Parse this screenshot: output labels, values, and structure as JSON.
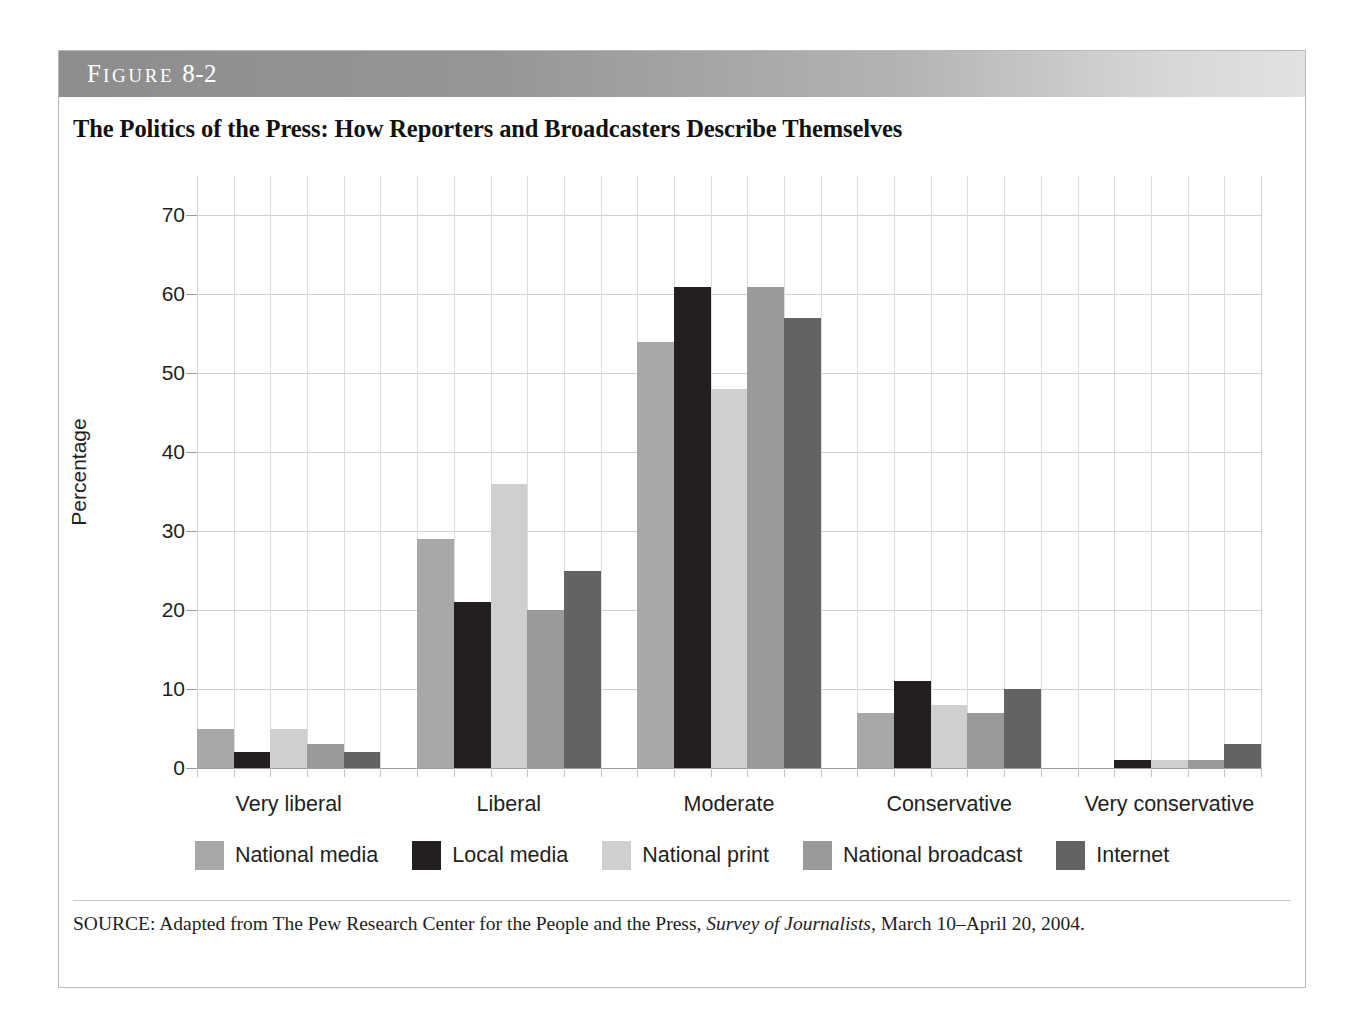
{
  "figure": {
    "label_prefix": "F",
    "label_word": "IGURE",
    "number": "8-2",
    "title": "The Politics of the Press: How Reporters and Broadcasters Describe Themselves",
    "source_prefix": "SOURCE: Adapted from The Pew Research Center for the People and the Press, ",
    "source_italic": "Survey of Journalists,",
    "source_suffix": " March 10–April 20, 2004."
  },
  "chart_data": {
    "type": "bar",
    "title": "The Politics of the Press: How Reporters and Broadcasters Describe Themselves",
    "xlabel": "",
    "ylabel": "Percentage",
    "ylim": [
      0,
      75
    ],
    "yticks": [
      0,
      10,
      20,
      30,
      40,
      50,
      60,
      70
    ],
    "ytick_labels": [
      "0",
      "10",
      "20",
      "30",
      "40",
      "50",
      "60",
      "70"
    ],
    "grid": true,
    "legend_position": "bottom",
    "categories": [
      "Very liberal",
      "Liberal",
      "Moderate",
      "Conservative",
      "Very conservative"
    ],
    "series": [
      {
        "name": "National media",
        "color": "#a8a8a8",
        "values": [
          5,
          29,
          54,
          7,
          0
        ]
      },
      {
        "name": "Local media",
        "color": "#231f20",
        "values": [
          2,
          21,
          61,
          11,
          1
        ]
      },
      {
        "name": "National print",
        "color": "#cfcfcf",
        "values": [
          5,
          36,
          48,
          8,
          1
        ]
      },
      {
        "name": "National broadcast",
        "color": "#9a9a9a",
        "values": [
          3,
          20,
          61,
          7,
          1
        ]
      },
      {
        "name": "Internet",
        "color": "#636363",
        "values": [
          2,
          25,
          57,
          10,
          3
        ]
      }
    ]
  },
  "colors": {
    "header_dark": "#8d8d8d",
    "header_light": "#e2e2e2",
    "frame_border": "#b9b9b9",
    "grid": "#d0d0d0",
    "text": "#231f20"
  }
}
